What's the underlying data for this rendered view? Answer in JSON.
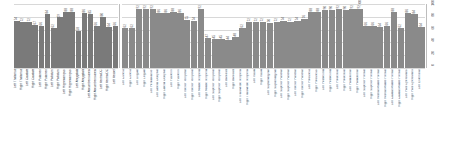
{
  "chart_data": {
    "type": "bar",
    "title": "",
    "xlabel": "",
    "ylabel": "",
    "grid": true,
    "legend": "none",
    "bar_color": "#8a8a8a",
    "panels": [
      {
        "name": "left-panel",
        "ylim": [
          0,
          100
        ],
        "yticks": [
          0,
          20,
          40,
          60,
          80,
          100
        ],
        "ytick_labels": [
          "0",
          "20",
          "40",
          "60",
          "80",
          "100"
        ],
        "categories": [
          "Left Thalamus",
          "Right Thalamus",
          "Left Caudate",
          "Right Caudate",
          "Left Putamen",
          "Right Putamen",
          "Left Pallidum",
          "Right Pallidum",
          "Left Hippocampus",
          "Right Hippocampus",
          "Left Amygdala",
          "Right Amygdala",
          "Left Accumbens area",
          "Right Accumbens area",
          "Left VentralDC",
          "Right VentralDC",
          "Left Vessel"
        ],
        "values": [
          74,
          72,
          72,
          67,
          66,
          84,
          62,
          79,
          88,
          88,
          58,
          86,
          85,
          66,
          80,
          64,
          66
        ],
        "value_labels": [
          "74",
          "72",
          "72",
          "67",
          "66",
          "84",
          "62",
          "79",
          "88",
          "88",
          "58",
          "86",
          "85",
          "66",
          "80",
          "64",
          "66"
        ]
      },
      {
        "name": "right-panel",
        "ylim": [
          0,
          100
        ],
        "yticks": [
          0,
          20,
          40,
          60,
          80,
          100
        ],
        "ytick_labels": [
          "0",
          "20",
          "40",
          "60",
          "80",
          "100"
        ],
        "categories": [
          "Left Cuneus",
          "Right Cuneus",
          "Left Lingual",
          "Right Lingual",
          "Left Pericalcarine",
          "Left Lateral Occipital",
          "Right Lateral Occipital",
          "Left Fusiform",
          "Right Fusiform",
          "Left Inferior Temporal",
          "Right Inferior Temporal",
          "Left Middle Temporal",
          "Right Middle Temporal",
          "Left Superior Temporal",
          "Right Superior Temporal",
          "Left Bankssts",
          "Right Bankssts",
          "Left Transverse Temporal",
          "Right Transverse Temporal",
          "Left Insula",
          "Right Insula",
          "Left Supramarginal",
          "Right Supramarginal",
          "Left Superior Parietal",
          "Right Superior Parietal",
          "Left Inferior Parietal",
          "Right Inferior Parietal",
          "Left Precuneus",
          "Right Precuneus",
          "Left Postcentral",
          "Right Postcentral",
          "Left Precentral",
          "Right Precentral",
          "Left Paracentral",
          "Right Paracentral",
          "Left Superior Frontal",
          "Right Superior Frontal",
          "Left Rostral Middle Frontal",
          "Right Rostral Middle Frontal",
          "Left Caudal Middle Frontal",
          "Right Caudal Middle Frontal",
          "Left Pars Opercularis",
          "Right Pars Opercularis",
          "Left Entorhinal"
        ],
        "values": [
          62,
          62,
          92,
          92,
          92,
          86,
          86,
          88,
          86,
          75,
          74,
          92,
          47,
          45,
          45,
          44,
          48,
          62,
          72,
          72,
          72,
          70,
          72,
          74,
          72,
          74,
          76,
          88,
          88,
          90,
          90,
          92,
          90,
          92,
          92,
          66,
          66,
          64,
          66,
          88,
          62,
          86,
          84,
          64
        ],
        "value_labels": [
          "62",
          "62",
          "92",
          "92",
          "92",
          "86",
          "86",
          "88",
          "86",
          "75",
          "74",
          "92",
          "47",
          "45",
          "45",
          "44",
          "48",
          "62",
          "72",
          "72",
          "72",
          "70",
          "72",
          "74",
          "72",
          "74",
          "76",
          "88",
          "88",
          "90",
          "90",
          "92",
          "90",
          "92",
          "92",
          "66",
          "66",
          "64",
          "66",
          "88",
          "62",
          "86",
          "84",
          "64"
        ]
      }
    ]
  }
}
